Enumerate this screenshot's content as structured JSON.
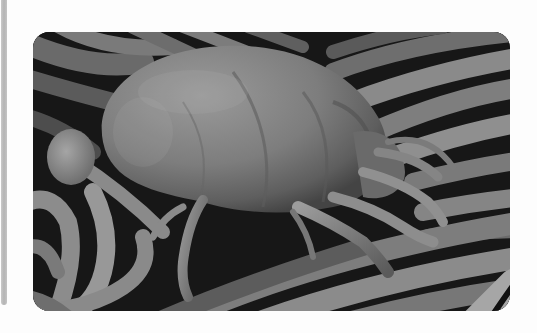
{
  "figure": {
    "alt": "Scanning electron micrograph of a dust mite resting on fibers",
    "subject": "dust mite",
    "background": "fibers",
    "colors": {
      "page_background": "#fdfdfd",
      "side_bar": "#b8b8b8",
      "image_dark": "#151515",
      "image_mid": "#7a7a7a",
      "image_light": "#bdbdbd"
    }
  }
}
